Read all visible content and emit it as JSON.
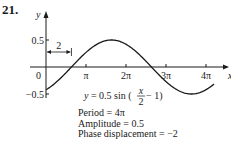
{
  "problem_number": "21.",
  "chart_data": {
    "type": "line",
    "title": "",
    "xlabel": "x",
    "ylabel": "y",
    "function": "y = 0.5 sin (x/2 - 1)",
    "amplitude": 0.5,
    "period_over_pi": 4,
    "phase_shift": 2,
    "xlim_over_pi": [
      0,
      4.2
    ],
    "ylim": [
      -0.5,
      0.5
    ],
    "x_ticks": [
      {
        "value_over_pi": 1,
        "label": "π"
      },
      {
        "value_over_pi": 2,
        "label": "2π"
      },
      {
        "value_over_pi": 3,
        "label": "3π"
      },
      {
        "value_over_pi": 4,
        "label": "4π"
      }
    ],
    "y_ticks": [
      {
        "value": 0.5,
        "label": "0.5"
      },
      {
        "value": -0.5,
        "label": "−0.5"
      }
    ],
    "origin_label": "0",
    "curve_x_range": [
      0,
      13.2
    ],
    "annotation": {
      "label": "2",
      "from_x": 0,
      "to_x": 2
    },
    "legend": "none",
    "grid": false
  },
  "equation": {
    "prefix": "y = 0.5 sin (",
    "numerator": "x",
    "denominator": "2",
    "suffix": " − 1)"
  },
  "notes": [
    "Period = 4π",
    "Amplitude = 0.5",
    "Phase displacement = −2"
  ]
}
